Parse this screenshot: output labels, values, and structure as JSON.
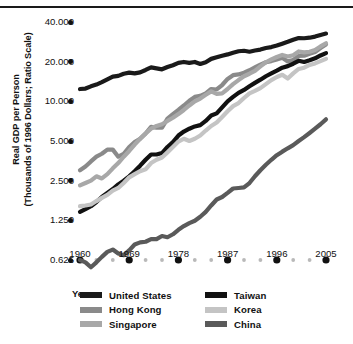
{
  "chart_data": {
    "type": "line",
    "title": "",
    "xlabel": "Year",
    "ylabel": "Real GDP per Person (Thousands of 1996 Dollars; Ratio Scale)",
    "ylabel_line1": "Real GDP per Person",
    "ylabel_line2": "(Thousands of 1996 Dollars; Ratio Scale)",
    "scale": "log",
    "grid": false,
    "legend_position": "bottom",
    "xlim": [
      1960,
      2005
    ],
    "ylim": [
      0.625,
      40.0
    ],
    "y_ticks": [
      0.625,
      1.25,
      2.5,
      5.0,
      10.0,
      20.0,
      40.0
    ],
    "y_tick_labels": [
      "0.625",
      "1.250",
      "2.500",
      "5.000",
      "10.000",
      "20.000",
      "40.000"
    ],
    "x_ticks": [
      1960,
      1969,
      1978,
      1987,
      1996,
      2005
    ],
    "x_tick_labels": [
      "1960",
      "1969",
      "1978",
      "1987",
      "1996",
      "2005"
    ],
    "x_minor_ticks": [
      1963,
      1966,
      1972,
      1975,
      1981,
      1984,
      1990,
      1993,
      1999,
      2002
    ],
    "x": [
      1960,
      1961,
      1962,
      1963,
      1964,
      1965,
      1966,
      1967,
      1968,
      1969,
      1970,
      1971,
      1972,
      1973,
      1974,
      1975,
      1976,
      1977,
      1978,
      1979,
      1980,
      1981,
      1982,
      1983,
      1984,
      1985,
      1986,
      1987,
      1988,
      1989,
      1990,
      1991,
      1992,
      1993,
      1994,
      1995,
      1996,
      1997,
      1998,
      1999,
      2000,
      2001,
      2002,
      2003,
      2004,
      2005
    ],
    "series": [
      {
        "name": "United States",
        "color": "#1a1a1a",
        "values": [
          12.4,
          12.5,
          13.0,
          13.4,
          14.0,
          14.7,
          15.4,
          15.6,
          16.2,
          16.5,
          16.3,
          16.6,
          17.3,
          18.1,
          17.8,
          17.5,
          18.2,
          18.8,
          19.6,
          19.9,
          19.6,
          19.9,
          19.2,
          19.8,
          21.0,
          21.6,
          22.2,
          22.7,
          23.4,
          24.0,
          24.2,
          23.8,
          24.3,
          24.7,
          25.4,
          25.8,
          26.5,
          27.4,
          28.3,
          29.3,
          30.2,
          30.1,
          30.4,
          31.0,
          31.9,
          32.7
        ]
      },
      {
        "name": "Hong Kong",
        "color": "#8a8a8a",
        "values": [
          3.0,
          3.2,
          3.5,
          3.8,
          4.0,
          4.3,
          4.3,
          3.8,
          4.0,
          4.5,
          4.9,
          5.2,
          5.7,
          6.4,
          6.3,
          6.3,
          7.4,
          8.0,
          8.6,
          9.3,
          10.1,
          10.8,
          11.0,
          11.5,
          12.4,
          12.3,
          13.3,
          14.8,
          15.8,
          16.0,
          16.5,
          17.2,
          18.1,
          19.0,
          19.8,
          20.2,
          20.8,
          21.4,
          20.1,
          20.6,
          22.1,
          22.2,
          23.0,
          23.7,
          25.4,
          27.0
        ]
      },
      {
        "name": "Singapore",
        "color": "#a8a8a8",
        "values": [
          2.3,
          2.4,
          2.5,
          2.7,
          2.6,
          2.8,
          3.1,
          3.4,
          3.8,
          4.2,
          4.7,
          5.2,
          5.7,
          6.2,
          6.5,
          6.7,
          7.1,
          7.5,
          8.0,
          8.6,
          9.3,
          10.0,
          10.5,
          11.2,
          11.9,
          11.4,
          11.5,
          12.4,
          13.5,
          14.5,
          15.5,
          16.2,
          17.0,
          18.4,
          19.8,
          20.8,
          21.7,
          22.5,
          21.9,
          22.4,
          23.9,
          23.5,
          23.8,
          24.5,
          26.1,
          27.6
        ]
      },
      {
        "name": "Taiwan",
        "color": "#111111",
        "values": [
          1.45,
          1.52,
          1.6,
          1.72,
          1.88,
          2.02,
          2.16,
          2.34,
          2.5,
          2.7,
          2.95,
          3.25,
          3.6,
          3.95,
          3.95,
          4.05,
          4.5,
          4.9,
          5.5,
          5.9,
          6.2,
          6.45,
          6.6,
          7.1,
          7.8,
          8.1,
          9.0,
          10.0,
          10.8,
          11.6,
          12.2,
          13.0,
          13.8,
          14.6,
          15.5,
          16.3,
          17.1,
          18.0,
          18.5,
          19.3,
          20.3,
          19.9,
          20.5,
          21.2,
          22.3,
          23.2
        ]
      },
      {
        "name": "Korea",
        "color": "#c4c4c4",
        "values": [
          1.6,
          1.62,
          1.65,
          1.75,
          1.85,
          1.95,
          2.1,
          2.2,
          2.4,
          2.65,
          2.8,
          2.95,
          3.05,
          3.4,
          3.6,
          3.75,
          4.1,
          4.5,
          4.95,
          5.2,
          5.0,
          5.2,
          5.5,
          6.0,
          6.5,
          6.9,
          7.6,
          8.4,
          9.2,
          9.7,
          10.6,
          11.5,
          12.0,
          12.6,
          13.5,
          14.5,
          15.3,
          15.9,
          14.9,
          16.3,
          17.6,
          18.0,
          18.9,
          19.4,
          20.2,
          21.0
        ]
      },
      {
        "name": "China",
        "color": "#5a5a5a",
        "values": [
          0.625,
          0.6,
          0.55,
          0.6,
          0.66,
          0.72,
          0.75,
          0.7,
          0.68,
          0.74,
          0.82,
          0.85,
          0.86,
          0.9,
          0.9,
          0.95,
          0.93,
          0.98,
          1.06,
          1.13,
          1.19,
          1.24,
          1.33,
          1.45,
          1.62,
          1.8,
          1.88,
          2.02,
          2.18,
          2.2,
          2.22,
          2.4,
          2.7,
          3.0,
          3.3,
          3.6,
          3.9,
          4.15,
          4.4,
          4.65,
          5.0,
          5.35,
          5.75,
          6.2,
          6.7,
          7.3
        ]
      }
    ]
  },
  "axis": {
    "year_label": "Year"
  },
  "legend": {
    "left_column": [
      {
        "label": "United States",
        "color": "#1a1a1a"
      },
      {
        "label": "Hong Kong",
        "color": "#8a8a8a"
      },
      {
        "label": "Singapore",
        "color": "#a8a8a8"
      }
    ],
    "right_column": [
      {
        "label": "Taiwan",
        "color": "#111111"
      },
      {
        "label": "Korea",
        "color": "#c4c4c4"
      },
      {
        "label": "China",
        "color": "#5a5a5a"
      }
    ]
  }
}
